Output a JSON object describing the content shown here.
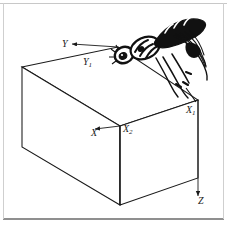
{
  "figure": {
    "type": "technical-line-diagram",
    "background_color": "#ffffff",
    "line_color": "#1a1a1a",
    "frame_color": "#c8c8c8",
    "labels": {
      "y_axis": "Y",
      "y1_edge": "Y",
      "y1_sub": "1",
      "x_axis": "X",
      "x1_edge": "X",
      "x1_sub": "1",
      "x2_edge": "X",
      "x2_sub": "2",
      "z_axis": "Z"
    },
    "objects": {
      "box_name": "rectangular-box",
      "insect_name": "insect-illustration"
    }
  }
}
